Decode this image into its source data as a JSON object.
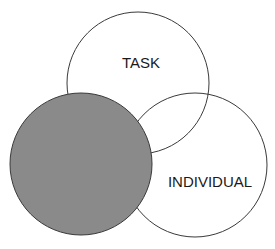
{
  "diagram": {
    "type": "three-circle-venn",
    "colors": {
      "background": "#ffffff",
      "outline": "#3a3a3a",
      "highlight_fill": "#8a8a8a",
      "text": "#1a1a1a"
    },
    "circles": [
      {
        "id": "task",
        "label": "TASK",
        "highlighted": false
      },
      {
        "id": "individual",
        "label": "INDIVIDUAL",
        "highlighted": false
      },
      {
        "id": "team",
        "label": "",
        "highlighted": true
      }
    ]
  }
}
